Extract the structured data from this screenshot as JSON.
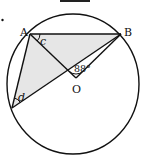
{
  "diagram": {
    "colors": {
      "stroke": "#111111",
      "shade": "#e6e6e6",
      "background": "#ffffff"
    },
    "circle": {
      "cx": 73,
      "cy": 84,
      "rx": 66,
      "ry": 70
    },
    "points": {
      "A": {
        "label": "A",
        "x": 30,
        "y": 34
      },
      "B": {
        "label": "B",
        "x": 121,
        "y": 34
      },
      "O": {
        "label": "O",
        "x": 76,
        "y": 78
      },
      "D": {
        "label": "",
        "x": 12,
        "y": 108
      }
    },
    "angles": {
      "c": {
        "label": "c",
        "at": "A"
      },
      "d": {
        "label": "d",
        "at": "D"
      },
      "AOB": {
        "label": "88°",
        "at": "O"
      }
    },
    "shaded_region": "triangle ABD"
  }
}
